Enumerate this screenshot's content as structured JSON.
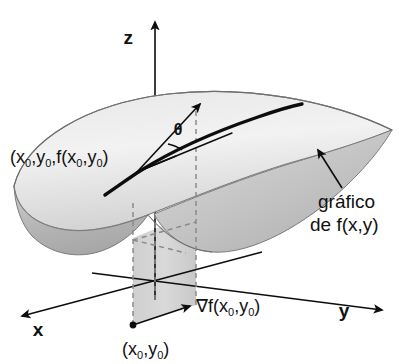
{
  "figure": {
    "type": "3d-surface-diagram",
    "language": "pt-BR",
    "background_color": "#ffffff",
    "ink_color": "#111111",
    "surface_top_color": "#efefef",
    "surface_shadow_color": "#b9b9b9",
    "plane_color": "#cfcfcf",
    "dashed_color": "#8a8a8a"
  },
  "axes": {
    "x_label": "x",
    "y_label": "y",
    "z_label": "z"
  },
  "labels": {
    "surface_point": {
      "prefix": "(x",
      "sub1": "0",
      "mid1": ",y",
      "sub2": "0",
      "mid2": ",f(x",
      "sub3": "0",
      "mid3": ",y",
      "sub4": "0",
      "suffix": ")",
      "plain": "(x0,y0,f(x0,y0)"
    },
    "gradient": {
      "nabla": "∇f(x",
      "sub1": "0",
      "mid1": ",y",
      "sub2": "0",
      "suffix": ")",
      "plain": "∇f(x0,y0)"
    },
    "base_point": {
      "prefix": "(x",
      "sub1": "0",
      "mid1": ",y",
      "sub2": "0",
      "suffix": ")",
      "plain": "(x0,y0)"
    },
    "graph_caption_line1": "gráfico",
    "graph_caption_line2": "de f(x,y)",
    "angle": "θ"
  },
  "icons": {
    "z_axis_arrow": "arrow-up-icon",
    "x_axis_arrow": "arrow-down-left-icon",
    "y_axis_arrow": "arrow-down-right-icon",
    "gradient_arrow": "arrow-up-right-icon",
    "tangent_arrow": "arrow-up-right-icon",
    "caption_pointer": "arrow-up-left-icon",
    "base_point_marker": "dot-icon"
  }
}
